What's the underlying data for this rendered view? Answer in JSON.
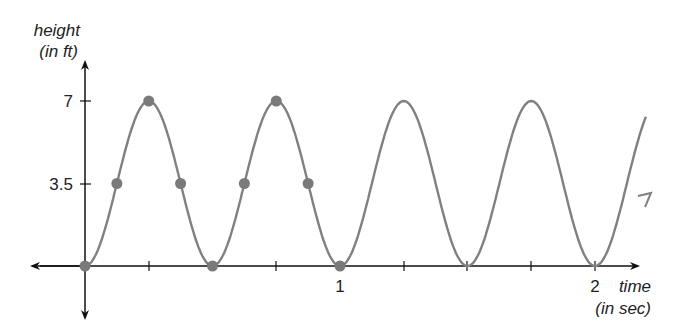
{
  "chart_data": {
    "type": "line",
    "title": "",
    "xlabel": "time",
    "xlabel_unit": "(in sec)",
    "ylabel": "height",
    "ylabel_unit": "(in ft)",
    "x_ticks": [
      0.25,
      0.5,
      0.75,
      1,
      1.25,
      1.5,
      1.75,
      2
    ],
    "x_tick_labels": {
      "1": "1",
      "2": "2"
    },
    "y_ticks": [
      3.5,
      7
    ],
    "y_tick_labels": [
      "3.5",
      "7"
    ],
    "xlim": [
      -0.2,
      2.25
    ],
    "ylim": [
      -1.2,
      9
    ],
    "grid": false,
    "series": [
      {
        "name": "height",
        "function": "h(t) = 3.5 - 3.5*cos(4*pi*t)",
        "marked_points": {
          "x": [
            0,
            0.125,
            0.25,
            0.375,
            0.5,
            0.625,
            0.75,
            0.875,
            1.0
          ],
          "y": [
            0,
            3.5,
            7,
            3.5,
            0,
            3.5,
            7,
            3.5,
            0
          ]
        },
        "color": "#808080"
      }
    ],
    "note": "Curve continues past t=2 with an arrow"
  },
  "labels": {
    "y_title": "height",
    "y_unit": "(in ft)",
    "x_title": "time",
    "x_unit": "(in sec)",
    "y7": "7",
    "y35": "3.5",
    "x1": "1",
    "x2": "2"
  }
}
